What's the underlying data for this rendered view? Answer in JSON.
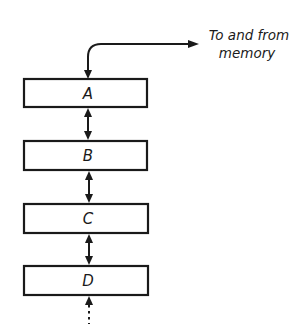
{
  "diagram": {
    "type": "register-stack",
    "memory_label": {
      "line1": "To and from",
      "line2": "memory"
    },
    "registers": [
      {
        "label": "A"
      },
      {
        "label": "B"
      },
      {
        "label": "C"
      },
      {
        "label": "D"
      }
    ],
    "connections": [
      {
        "from": "A",
        "to": "memory",
        "style": "bidirectional-curved"
      },
      {
        "from": "A",
        "to": "B",
        "style": "bidirectional"
      },
      {
        "from": "B",
        "to": "C",
        "style": "bidirectional"
      },
      {
        "from": "C",
        "to": "D",
        "style": "bidirectional"
      },
      {
        "from": "D",
        "to": "continuation",
        "style": "dotted-upward"
      }
    ],
    "colors": {
      "ink": "#1a1a1a",
      "background": "#ffffff"
    }
  }
}
